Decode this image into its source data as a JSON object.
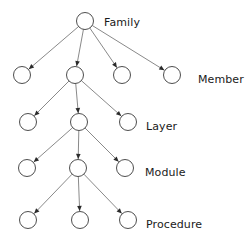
{
  "diagram": {
    "type": "tree",
    "background_color": "#ffffff",
    "node_stroke_color": "#3a3a3a",
    "node_fill_color": "#ffffff",
    "edge_color": "#6b6b6b",
    "arrow_color": "#2b2b2b",
    "label_color": "#1a1a1a",
    "node_radius": 8.5,
    "levels": [
      {
        "id": "level-family",
        "label": "Family",
        "label_x": 104,
        "label_y": 17,
        "row_y": 21,
        "nodes": [
          {
            "id": "family-1",
            "cx": 85,
            "cy": 21
          }
        ]
      },
      {
        "id": "level-member",
        "label": "Member",
        "label_x": 198,
        "label_y": 74,
        "row_y": 75,
        "nodes": [
          {
            "id": "member-1",
            "cx": 22,
            "cy": 75
          },
          {
            "id": "member-2",
            "cx": 75,
            "cy": 75
          },
          {
            "id": "member-3",
            "cx": 122,
            "cy": 75
          },
          {
            "id": "member-4",
            "cx": 172,
            "cy": 75
          }
        ]
      },
      {
        "id": "level-layer",
        "label": "Layer",
        "label_x": 146,
        "label_y": 121,
        "row_y": 122,
        "nodes": [
          {
            "id": "layer-1",
            "cx": 28,
            "cy": 122
          },
          {
            "id": "layer-2",
            "cx": 79,
            "cy": 122
          },
          {
            "id": "layer-3",
            "cx": 128,
            "cy": 122
          }
        ]
      },
      {
        "id": "level-module",
        "label": "Module",
        "label_x": 145,
        "label_y": 167,
        "row_y": 168,
        "nodes": [
          {
            "id": "module-1",
            "cx": 27,
            "cy": 168
          },
          {
            "id": "module-2",
            "cx": 78,
            "cy": 168
          },
          {
            "id": "module-3",
            "cx": 125,
            "cy": 168
          }
        ]
      },
      {
        "id": "level-procedure",
        "label": "Procedure",
        "label_x": 146,
        "label_y": 219,
        "row_y": 220,
        "nodes": [
          {
            "id": "procedure-1",
            "cx": 28,
            "cy": 220
          },
          {
            "id": "procedure-2",
            "cx": 80,
            "cy": 220
          },
          {
            "id": "procedure-3",
            "cx": 128,
            "cy": 220
          }
        ]
      }
    ],
    "edges": [
      {
        "id": "e-family1-member1",
        "from": "family-1",
        "to": "member-1"
      },
      {
        "id": "e-family1-member2",
        "from": "family-1",
        "to": "member-2"
      },
      {
        "id": "e-family1-member3",
        "from": "family-1",
        "to": "member-3"
      },
      {
        "id": "e-family1-member4",
        "from": "family-1",
        "to": "member-4"
      },
      {
        "id": "e-member2-layer1",
        "from": "member-2",
        "to": "layer-1"
      },
      {
        "id": "e-member2-layer2",
        "from": "member-2",
        "to": "layer-2"
      },
      {
        "id": "e-member2-layer3",
        "from": "member-2",
        "to": "layer-3"
      },
      {
        "id": "e-layer2-module1",
        "from": "layer-2",
        "to": "module-1"
      },
      {
        "id": "e-layer2-module2",
        "from": "layer-2",
        "to": "module-2"
      },
      {
        "id": "e-layer2-module3",
        "from": "layer-2",
        "to": "module-3"
      },
      {
        "id": "e-module2-procedure1",
        "from": "module-2",
        "to": "procedure-1"
      },
      {
        "id": "e-module2-procedure2",
        "from": "module-2",
        "to": "procedure-2"
      },
      {
        "id": "e-module2-procedure3",
        "from": "module-2",
        "to": "procedure-3"
      }
    ]
  }
}
